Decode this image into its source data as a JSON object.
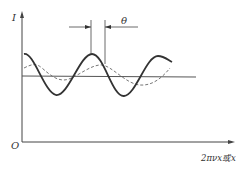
{
  "diagram": {
    "y_axis_label": "I",
    "x_axis_label": "2πνx或x",
    "origin_label": "O",
    "phase_label": "θ",
    "series": [
      {
        "name": "solid-wave",
        "style": "solid",
        "color": "#333333"
      },
      {
        "name": "dashed-wave",
        "style": "dashed",
        "color": "#555555"
      },
      {
        "name": "mean-level-line",
        "style": "solid",
        "color": "#444444"
      }
    ]
  }
}
